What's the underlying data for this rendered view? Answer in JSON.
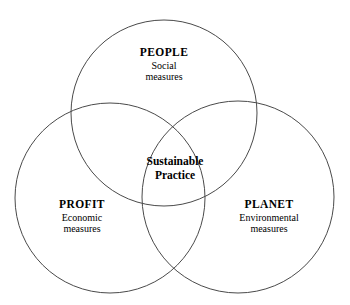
{
  "diagram": {
    "type": "venn",
    "background_color": "#ffffff",
    "stroke_color": "#4a4a4a",
    "circles": [
      {
        "id": "people",
        "title": "PEOPLE",
        "subtitle_line1": "Social",
        "subtitle_line2": "measures",
        "cx": 164,
        "cy": 113,
        "r": 93
      },
      {
        "id": "profit",
        "title": "PROFIT",
        "subtitle_line1": "Economic",
        "subtitle_line2": "measures",
        "cx": 110,
        "cy": 198,
        "r": 95
      },
      {
        "id": "planet",
        "title": "PLANET",
        "subtitle_line1": "Environmental",
        "subtitle_line2": "measures",
        "cx": 238,
        "cy": 197,
        "r": 96
      }
    ],
    "intersection": {
      "line1": "Sustainable",
      "line2": "Practice"
    }
  }
}
